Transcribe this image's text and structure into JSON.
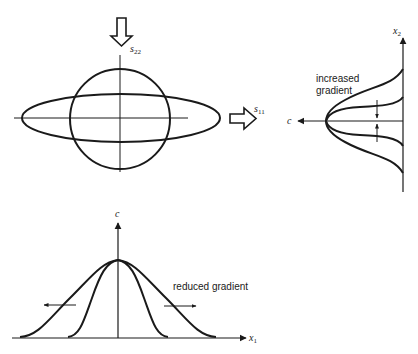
{
  "figure": {
    "panels": {
      "stress_state": {
        "load_top_label": "s",
        "load_top_subscript": "22",
        "load_right_label": "s",
        "load_right_subscript": "11"
      },
      "profile_x2": {
        "axis_vertical_label": "x",
        "axis_vertical_subscript": "2",
        "axis_horizontal_label": "c",
        "annotation_line1": "increased",
        "annotation_line2": "gradient"
      },
      "profile_x1": {
        "axis_vertical_label": "c",
        "axis_horizontal_label": "x",
        "axis_horizontal_subscript": "1",
        "annotation": "reduced gradient"
      }
    },
    "colors": {
      "ink": "#1a1a1a",
      "background": "#ffffff"
    }
  }
}
